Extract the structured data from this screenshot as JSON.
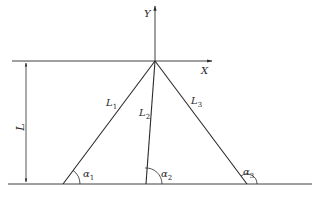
{
  "diagram": {
    "type": "geometry",
    "colors": {
      "stroke": "#2a2a2a",
      "background": "#ffffff"
    },
    "axes": {
      "x_label": "X",
      "y_label": "Y"
    },
    "dimension": {
      "label": "L"
    },
    "segments": [
      {
        "name": "L",
        "sub": "1"
      },
      {
        "name": "L",
        "sub": "2"
      },
      {
        "name": "L",
        "sub": "3"
      }
    ],
    "angles": [
      {
        "name": "α",
        "sub": "1"
      },
      {
        "name": "α",
        "sub": "2"
      },
      {
        "name": "α",
        "sub": "3"
      }
    ]
  }
}
